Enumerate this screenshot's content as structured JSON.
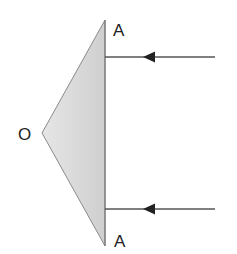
{
  "diagram": {
    "type": "prism-reflection-ray-diagram",
    "labels": {
      "vertex_left": "O",
      "vertex_top": "A",
      "vertex_bottom": "A"
    },
    "shape": {
      "kind": "triangle",
      "fill": "#d6d6d6",
      "stroke": "#8a8a8a",
      "points": {
        "top": [
          105,
          20
        ],
        "left": [
          42,
          133
        ],
        "bottom": [
          105,
          246
        ]
      }
    },
    "rays": [
      {
        "name": "upper-incident-ray",
        "direction": "right-to-left",
        "y": 57,
        "x_start": 215,
        "x_end": 105,
        "arrow_x": 150
      },
      {
        "name": "lower-incident-ray",
        "direction": "right-to-left",
        "y": 209,
        "x_start": 215,
        "x_end": 105,
        "arrow_x": 150
      }
    ],
    "colors": {
      "ray": "#555555",
      "arrowhead": "#222222",
      "text": "#222222"
    }
  }
}
